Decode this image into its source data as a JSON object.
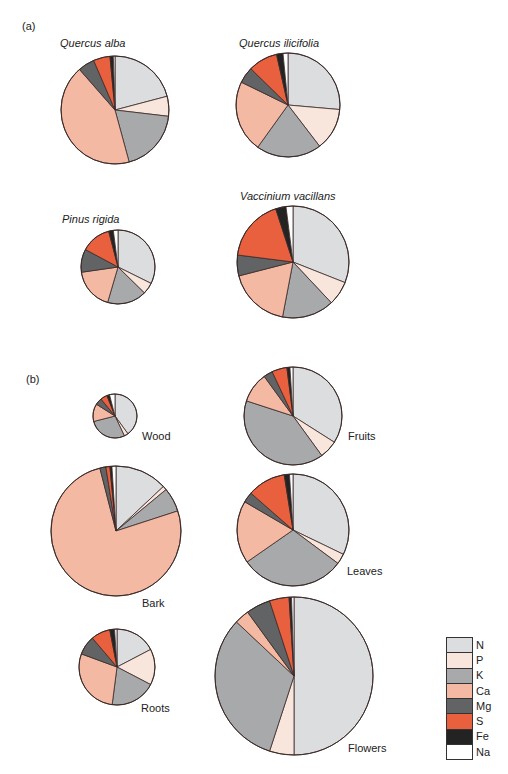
{
  "panels": [
    {
      "label": "(a)",
      "x": 22,
      "y": 20
    },
    {
      "label": "(b)",
      "x": 26,
      "y": 373
    }
  ],
  "legend": [
    {
      "element": "N",
      "color": "#dcdddf"
    },
    {
      "element": "P",
      "color": "#f8e6dc"
    },
    {
      "element": "K",
      "color": "#a8a9ab"
    },
    {
      "element": "Ca",
      "color": "#f4b9a3"
    },
    {
      "element": "Mg",
      "color": "#626365"
    },
    {
      "element": "S",
      "color": "#e9603e"
    },
    {
      "element": "Fe",
      "color": "#232323"
    },
    {
      "element": "Na",
      "color": "#ffffff"
    }
  ],
  "chart_data": {
    "type": "pie",
    "title": "",
    "legend_position": "bottom-right",
    "categories": [
      "N",
      "P",
      "K",
      "Ca",
      "Mg",
      "S",
      "Fe",
      "Na"
    ],
    "panels": [
      {
        "panel": "(a)",
        "pies": [
          {
            "name": "Quercus alba",
            "label_style": "title",
            "cx": 115,
            "cy": 110,
            "r": 54,
            "label_x": 60,
            "label_y": 37,
            "values": [
              21,
              6,
              19,
              43,
              5,
              5,
              1,
              0.5
            ]
          },
          {
            "name": "Quercus ilicifolia",
            "label_style": "title",
            "cx": 288,
            "cy": 105,
            "r": 52,
            "label_x": 239,
            "label_y": 37,
            "values": [
              26,
              13,
              20,
              22,
              5,
              9,
              2,
              1.5
            ]
          },
          {
            "name": "Pinus rigida",
            "label_style": "title",
            "cx": 118,
            "cy": 267,
            "r": 37,
            "label_x": 62,
            "label_y": 213,
            "values": [
              32,
              5,
              17,
              18,
              10,
              13,
              2,
              2
            ]
          },
          {
            "name": "Vaccinium vacillans",
            "label_style": "title",
            "cx": 293,
            "cy": 262,
            "r": 56,
            "label_x": 240,
            "label_y": 190,
            "values": [
              31,
              7,
              15,
              18,
              6,
              18,
              3,
              2
            ]
          }
        ]
      },
      {
        "panel": "(b)",
        "pies": [
          {
            "name": "Wood",
            "label_style": "tag",
            "cx": 115,
            "cy": 416,
            "r": 22,
            "label_x": 142,
            "label_y": 430,
            "values": [
              40,
              3,
              28,
              13,
              5,
              5,
              2,
              4
            ]
          },
          {
            "name": "Fruits",
            "label_style": "tag",
            "cx": 293,
            "cy": 416,
            "r": 49,
            "label_x": 348,
            "label_y": 430,
            "values": [
              34,
              6,
              40,
              10,
              3,
              5,
              1,
              1
            ]
          },
          {
            "name": "Bark",
            "label_style": "tag",
            "cx": 116,
            "cy": 531,
            "r": 65,
            "label_x": 142,
            "label_y": 597,
            "values": [
              13,
              1,
              6,
              76,
              1.5,
              1,
              0.5,
              1
            ]
          },
          {
            "name": "Leaves",
            "label_style": "tag",
            "cx": 293,
            "cy": 530,
            "r": 56,
            "label_x": 347,
            "label_y": 565,
            "values": [
              32,
              3,
              30,
              18,
              3,
              11,
              1.5,
              1
            ]
          },
          {
            "name": "Roots",
            "label_style": "tag",
            "cx": 117,
            "cy": 667,
            "r": 38,
            "label_x": 141,
            "label_y": 702,
            "values": [
              17,
              15,
              19,
              28,
              8,
              8,
              2,
              1
            ]
          },
          {
            "name": "Flowers",
            "label_style": "tag",
            "cx": 294,
            "cy": 676,
            "r": 79,
            "label_x": 348,
            "label_y": 742,
            "values": [
              50,
              5,
              32,
              3,
              5,
              4,
              0.5,
              0.5
            ]
          }
        ]
      }
    ]
  }
}
